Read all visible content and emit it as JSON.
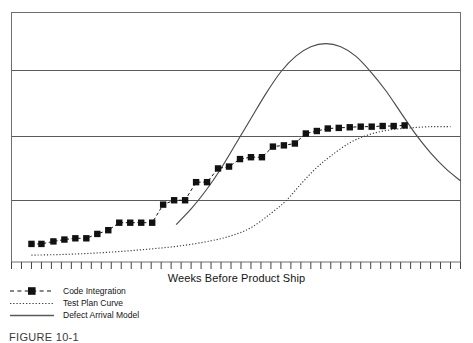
{
  "figure": {
    "caption": "FIGURE 10-1"
  },
  "chart_data": {
    "type": "line",
    "title": "",
    "subtitle": "",
    "xlabel": "Weeks Before Product Ship",
    "ylabel": "",
    "xlim": [
      0,
      45
    ],
    "ylim": [
      0,
      4
    ],
    "grid": "horizontal",
    "gridline_values": [
      0,
      1,
      2,
      3,
      4
    ],
    "x_tick_count": 45,
    "x_tick_labels": [],
    "y_tick_labels": [],
    "legend_position": "below-left",
    "series": [
      {
        "name": "Code Integration",
        "style": "dashed-with-square-markers",
        "color": "#111111",
        "marker": "square",
        "x": [
          2.0,
          3.0,
          4.2,
          5.3,
          6.4,
          7.5,
          8.6,
          9.7,
          10.8,
          11.9,
          13.0,
          14.1,
          15.2,
          16.3,
          17.4,
          18.5,
          19.6,
          20.7,
          21.8,
          22.9,
          24.0,
          25.1,
          26.2,
          27.3,
          28.4,
          29.5,
          30.6,
          31.7,
          32.8,
          33.9,
          35.0,
          36.1,
          37.2,
          38.3,
          39.4
        ],
        "values": [
          0.29,
          0.29,
          0.33,
          0.36,
          0.38,
          0.38,
          0.45,
          0.51,
          0.63,
          0.63,
          0.63,
          0.63,
          0.92,
          0.99,
          0.99,
          1.28,
          1.28,
          1.5,
          1.53,
          1.65,
          1.68,
          1.68,
          1.85,
          1.87,
          1.9,
          2.06,
          2.1,
          2.14,
          2.15,
          2.16,
          2.17,
          2.17,
          2.18,
          2.18,
          2.19
        ]
      },
      {
        "name": "Test Plan Curve",
        "style": "dotted",
        "color": "#3d3d3d",
        "marker": "none",
        "x": [
          2.0,
          5.0,
          8.0,
          11.0,
          14.0,
          17.0,
          20.0,
          22.0,
          24.0,
          26.0,
          27.5,
          29.0,
          30.5,
          32.0,
          34.0,
          36.0,
          38.0,
          40.0,
          42.0,
          44.0
        ],
        "values": [
          0.11,
          0.12,
          0.14,
          0.17,
          0.21,
          0.26,
          0.34,
          0.42,
          0.55,
          0.78,
          0.98,
          1.25,
          1.5,
          1.7,
          1.92,
          2.05,
          2.12,
          2.15,
          2.17,
          2.17
        ]
      },
      {
        "name": "Defect Arrival Model",
        "style": "solid",
        "color": "#4a4a4a",
        "marker": "none",
        "x": [
          16.5,
          18.0,
          19.5,
          21.0,
          22.5,
          24.0,
          25.5,
          27.0,
          28.5,
          30.0,
          31.5,
          33.0,
          34.5,
          36.0,
          37.5,
          39.0,
          40.5,
          42.0,
          43.5,
          45.0
        ],
        "values": [
          0.6,
          0.85,
          1.15,
          1.5,
          1.9,
          2.3,
          2.7,
          3.05,
          3.3,
          3.45,
          3.5,
          3.45,
          3.3,
          3.05,
          2.75,
          2.4,
          2.05,
          1.75,
          1.5,
          1.3
        ]
      }
    ],
    "legend": [
      {
        "label": "Code Integration",
        "style": "dashed-with-square-markers"
      },
      {
        "label": "Test Plan Curve",
        "style": "dotted"
      },
      {
        "label": "Defect Arrival Model",
        "style": "solid"
      }
    ]
  },
  "colors": {
    "frame": "#6e6e6e",
    "gridline": "#5a5a5a",
    "marker": "#111111",
    "dotted": "#3d3d3d",
    "solid": "#4a4a4a",
    "text": "#131313",
    "background": "#ffffff"
  }
}
